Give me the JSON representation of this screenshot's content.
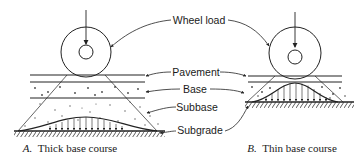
{
  "figure": {
    "labels": {
      "wheel_load": "Wheel load",
      "pavement": "Pavement",
      "base": "Base",
      "subbase": "Subbase",
      "subgrade": "Subgrade"
    },
    "panels": [
      {
        "letter": "A.",
        "caption": "Thick base course"
      },
      {
        "letter": "B.",
        "caption": "Thin base course"
      }
    ],
    "colors": {
      "ink": "#222222",
      "background": "#ffffff"
    }
  }
}
